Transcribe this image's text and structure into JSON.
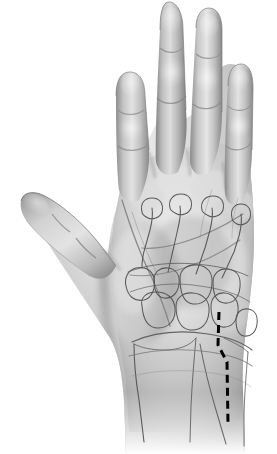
{
  "document": {
    "kind": "anatomical-illustration",
    "view": "palmar",
    "subject": "right hand",
    "title": "Hand, palmar view with skeletal outline and surgical incision marking",
    "background_color": "#ffffff",
    "width_px": 277,
    "height_px": 454
  },
  "palette": {
    "background": "#ffffff",
    "skin_light": "#f2f2f2",
    "skin_mid": "#c9c9c9",
    "skin_shadow": "#9a9a9a",
    "skin_deep_shadow": "#7a7a7a",
    "outline": "#6e6e6e",
    "bone_outline": "#4b4b4b",
    "crease": "#8a8a8a",
    "incision_line": "#000000"
  },
  "figure": {
    "label": "hand-illustration",
    "regions": [
      {
        "name": "thumb",
        "digit": 1,
        "position": "upper-left",
        "orientation": "abducted"
      },
      {
        "name": "index-finger",
        "digit": 2,
        "position": "left"
      },
      {
        "name": "middle-finger",
        "digit": 3,
        "position": "center",
        "note": "longest, reaches top edge"
      },
      {
        "name": "ring-finger",
        "digit": 4,
        "position": "right-of-center"
      },
      {
        "name": "little-finger",
        "digit": 5,
        "position": "far-right",
        "note": "shortest"
      },
      {
        "name": "palm",
        "note": "central, with flexion creases"
      },
      {
        "name": "thenar-eminence",
        "position": "radial-palm"
      },
      {
        "name": "hypothenar-eminence",
        "position": "ulnar-palm"
      },
      {
        "name": "wrist",
        "position": "bottom"
      },
      {
        "name": "distal-forearm",
        "position": "bottom",
        "note": "fades out"
      }
    ],
    "skeletal_outline": {
      "visible": true,
      "style": "faint line drawing overlaid on skin",
      "structures": [
        "metacarpals",
        "carpal bones",
        "distal radius",
        "distal ulna",
        "radiocarpal joint line",
        "carpometacarpal joint line"
      ]
    },
    "creases": {
      "visible": true,
      "items": [
        "distal palmar crease",
        "proximal palmar crease",
        "thenar crease",
        "distal wrist crease",
        "proximal digital creases",
        "interphalangeal creases"
      ]
    },
    "incision": {
      "name": "surgical-incision-marking",
      "style": "dashed",
      "color": "#000000",
      "stroke_width_px": 3,
      "dash_length_px": 8,
      "gap_length_px": 5,
      "location": "ulnar wrist / fourth–fifth carpometacarpal region",
      "description": "Longitudinal dashed line with a short oblique step, running distal to proximal across the ulnar carpus onto the distal forearm",
      "segments": [
        {
          "name": "distal-limb",
          "from_x": 219,
          "from_y": 312,
          "to_x": 218,
          "to_y": 345
        },
        {
          "name": "oblique-step",
          "from_x": 218,
          "from_y": 345,
          "to_x": 227,
          "to_y": 362
        },
        {
          "name": "proximal-limb",
          "from_x": 227,
          "from_y": 362,
          "to_x": 228,
          "to_y": 424
        }
      ]
    }
  }
}
